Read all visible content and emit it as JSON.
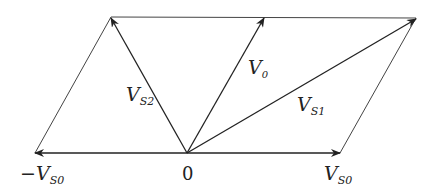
{
  "diagram": {
    "title": "",
    "type": "vector parallelogram",
    "origin_label": "0",
    "labels": {
      "v0": {
        "main": "V",
        "sub": "0"
      },
      "vs1": {
        "main": "V",
        "sub": "S1"
      },
      "vs2": {
        "main": "V",
        "sub": "S2"
      },
      "vs0": {
        "main": "V",
        "sub": "S0"
      },
      "neg_vs0": {
        "prefix": "−",
        "main": "V",
        "sub": "S0"
      }
    },
    "colors": {
      "line": "#2a2a2a",
      "background": "#ffffff"
    }
  }
}
